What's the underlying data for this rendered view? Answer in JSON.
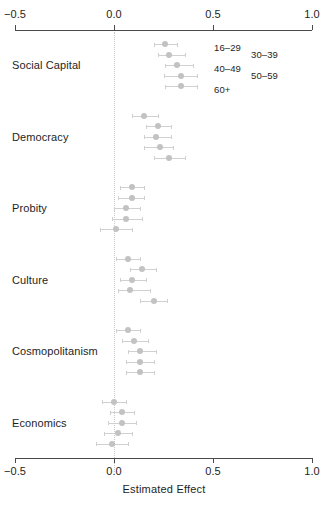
{
  "chart_data": {
    "type": "scatter",
    "title": "",
    "xlabel": "Estimated Effect",
    "ylabel": "",
    "xlim": [
      -0.5,
      1.0
    ],
    "xticks": [
      -0.5,
      0.0,
      0.5,
      1.0
    ],
    "xtick_labels": [
      "−0.5",
      "0.0",
      "0.5",
      "1.0"
    ],
    "grid": false,
    "zero_reference": 0.0,
    "legend_position": "top-right",
    "orientation": "horizontal-dotplot-with-error-bars",
    "series": [
      {
        "name": "16–29",
        "color": "#c2c2c2"
      },
      {
        "name": "30–39",
        "color": "#c2c2c2"
      },
      {
        "name": "40–49",
        "color": "#c2c2c2"
      },
      {
        "name": "50–59",
        "color": "#c2c2c2"
      },
      {
        "name": "60+",
        "color": "#c2c2c2"
      }
    ],
    "categories": [
      "Social Capital",
      "Democracy",
      "Probity",
      "Culture",
      "Cosmopolitanism",
      "Economics"
    ],
    "points": [
      {
        "category": "Social Capital",
        "series": "16–29",
        "estimate": 0.26,
        "lower": 0.2,
        "upper": 0.32
      },
      {
        "category": "Social Capital",
        "series": "30–39",
        "estimate": 0.28,
        "lower": 0.22,
        "upper": 0.36
      },
      {
        "category": "Social Capital",
        "series": "40–49",
        "estimate": 0.32,
        "lower": 0.26,
        "upper": 0.4
      },
      {
        "category": "Social Capital",
        "series": "50–59",
        "estimate": 0.34,
        "lower": 0.25,
        "upper": 0.42
      },
      {
        "category": "Social Capital",
        "series": "60+",
        "estimate": 0.34,
        "lower": 0.26,
        "upper": 0.42
      },
      {
        "category": "Democracy",
        "series": "16–29",
        "estimate": 0.15,
        "lower": 0.09,
        "upper": 0.22
      },
      {
        "category": "Democracy",
        "series": "30–39",
        "estimate": 0.22,
        "lower": 0.16,
        "upper": 0.29
      },
      {
        "category": "Democracy",
        "series": "40–49",
        "estimate": 0.21,
        "lower": 0.15,
        "upper": 0.29
      },
      {
        "category": "Democracy",
        "series": "50–59",
        "estimate": 0.23,
        "lower": 0.15,
        "upper": 0.3
      },
      {
        "category": "Democracy",
        "series": "60+",
        "estimate": 0.28,
        "lower": 0.2,
        "upper": 0.36
      },
      {
        "category": "Probity",
        "series": "16–29",
        "estimate": 0.09,
        "lower": 0.03,
        "upper": 0.15
      },
      {
        "category": "Probity",
        "series": "30–39",
        "estimate": 0.09,
        "lower": 0.02,
        "upper": 0.15
      },
      {
        "category": "Probity",
        "series": "40–49",
        "estimate": 0.06,
        "lower": 0.0,
        "upper": 0.13
      },
      {
        "category": "Probity",
        "series": "50–59",
        "estimate": 0.06,
        "lower": -0.01,
        "upper": 0.14
      },
      {
        "category": "Probity",
        "series": "60+",
        "estimate": 0.01,
        "lower": -0.07,
        "upper": 0.09
      },
      {
        "category": "Culture",
        "series": "16–29",
        "estimate": 0.07,
        "lower": 0.01,
        "upper": 0.13
      },
      {
        "category": "Culture",
        "series": "30–39",
        "estimate": 0.14,
        "lower": 0.08,
        "upper": 0.21
      },
      {
        "category": "Culture",
        "series": "40–49",
        "estimate": 0.09,
        "lower": 0.03,
        "upper": 0.16
      },
      {
        "category": "Culture",
        "series": "50–59",
        "estimate": 0.08,
        "lower": 0.02,
        "upper": 0.18
      },
      {
        "category": "Culture",
        "series": "60+",
        "estimate": 0.2,
        "lower": 0.13,
        "upper": 0.27
      },
      {
        "category": "Cosmopolitanism",
        "series": "16–29",
        "estimate": 0.07,
        "lower": 0.01,
        "upper": 0.13
      },
      {
        "category": "Cosmopolitanism",
        "series": "30–39",
        "estimate": 0.1,
        "lower": 0.04,
        "upper": 0.17
      },
      {
        "category": "Cosmopolitanism",
        "series": "40–49",
        "estimate": 0.13,
        "lower": 0.07,
        "upper": 0.21
      },
      {
        "category": "Cosmopolitanism",
        "series": "50–59",
        "estimate": 0.13,
        "lower": 0.06,
        "upper": 0.2
      },
      {
        "category": "Cosmopolitanism",
        "series": "60+",
        "estimate": 0.13,
        "lower": 0.06,
        "upper": 0.2
      },
      {
        "category": "Economics",
        "series": "16–29",
        "estimate": 0.0,
        "lower": -0.06,
        "upper": 0.06
      },
      {
        "category": "Economics",
        "series": "30–39",
        "estimate": 0.04,
        "lower": -0.02,
        "upper": 0.1
      },
      {
        "category": "Economics",
        "series": "40–49",
        "estimate": 0.04,
        "lower": -0.03,
        "upper": 0.11
      },
      {
        "category": "Economics",
        "series": "50–59",
        "estimate": 0.02,
        "lower": -0.05,
        "upper": 0.09
      },
      {
        "category": "Economics",
        "series": "60+",
        "estimate": -0.01,
        "lower": -0.09,
        "upper": 0.07
      }
    ]
  },
  "legend": {
    "items": [
      {
        "label": "16–29"
      },
      {
        "label": "30–39"
      },
      {
        "label": "40–49"
      },
      {
        "label": "50–59"
      },
      {
        "label": "60+"
      }
    ]
  },
  "axis": {
    "top_labels": [
      "−0.5",
      "0.0",
      "0.5",
      "1.0"
    ],
    "bottom_labels": [
      "−0.5",
      "0.0",
      "0.5",
      "1.0"
    ],
    "title": "Estimated Effect"
  }
}
